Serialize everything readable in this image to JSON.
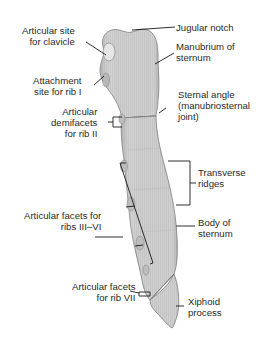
{
  "diagram": {
    "colors": {
      "bone_fill": "#d2d2d2",
      "bone_shade": "#a8a8a8",
      "bone_outline": "#7a7a7a",
      "leader_line": "#1a1a1a",
      "text": "#2a2a2a",
      "background": "#ffffff"
    },
    "labels": {
      "articular_site_clavicle": {
        "line1": "Articular site",
        "line2": "for clavicle"
      },
      "attachment_rib1": {
        "line1": "Attachment",
        "line2": "site for rib I"
      },
      "articular_demifacets_rib2": {
        "line1": "Articular",
        "line2": "demifacets",
        "line3": "for rib II"
      },
      "articular_facets_rib3_6": {
        "line1": "Articular facets for",
        "line2": "ribs III–VI"
      },
      "articular_facets_rib7": {
        "line1": "Articular facets",
        "line2": "for rib VII"
      },
      "jugular_notch": {
        "line1": "Jugular notch"
      },
      "manubrium": {
        "line1": "Manubrium of",
        "line2": "sternum"
      },
      "sternal_angle": {
        "line1": "Sternal angle",
        "line2": "(manubriosternal",
        "line3": "joint)"
      },
      "transverse_ridges": {
        "line1": "Transverse",
        "line2": "ridges"
      },
      "body_of_sternum": {
        "line1": "Body of",
        "line2": "sternum"
      },
      "xiphoid_process": {
        "line1": "Xiphoid",
        "line2": "process"
      }
    }
  }
}
